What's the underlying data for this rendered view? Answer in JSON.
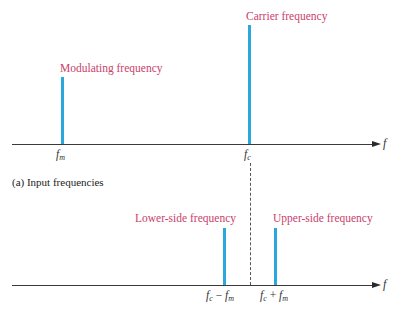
{
  "diagram": {
    "top_panel": {
      "caption": "(a) Input frequencies",
      "axis_label": "f",
      "components": [
        {
          "name": "modulating",
          "label": "Modulating frequency",
          "tick": "f",
          "tick_sub": "m"
        },
        {
          "name": "carrier",
          "label": "Carrier frequency",
          "tick": "f",
          "tick_sub": "c"
        }
      ]
    },
    "bottom_panel": {
      "axis_label": "f",
      "components": [
        {
          "name": "lower-side",
          "label": "Lower-side frequency",
          "tick_a": "f",
          "tick_a_sub": "c",
          "op": " − ",
          "tick_b": "f",
          "tick_b_sub": "m"
        },
        {
          "name": "upper-side",
          "label": "Upper-side frequency",
          "tick_a": "f",
          "tick_a_sub": "c",
          "op": " + ",
          "tick_b": "f",
          "tick_b_sub": "m"
        }
      ]
    },
    "colors": {
      "bar": "#2aa7dc",
      "label": "#c9416b",
      "axis": "#3a3a3a"
    }
  }
}
